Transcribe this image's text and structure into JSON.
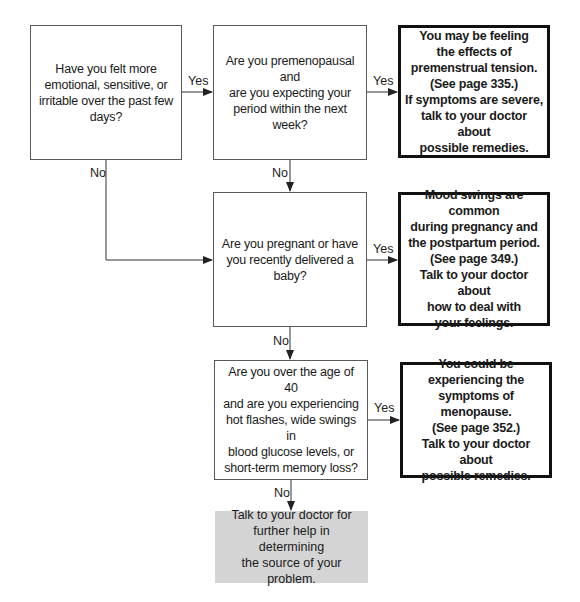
{
  "flowchart": {
    "nodes": {
      "q1": {
        "type": "question",
        "text": "Have you felt more\nemotional, sensitive, or\nirritable over the past few\ndays?"
      },
      "q2": {
        "type": "question",
        "text": "Are you premenopausal and\nare you expecting your\nperiod within the next week?"
      },
      "a1": {
        "type": "outcome",
        "text": "You may be feeling\nthe effects of\npremenstrual tension.\n(See page 335.)\nIf symptoms are severe,\ntalk to your doctor about\npossible remedies."
      },
      "q3": {
        "type": "question",
        "text": "Are you pregnant or have\nyou recently delivered a\nbaby?"
      },
      "a2": {
        "type": "outcome",
        "text": "Mood swings are common\nduring pregnancy and\nthe postpartum period.\n(See page 349.)\nTalk to your doctor about\nhow to deal with\nyour feelings."
      },
      "q4": {
        "type": "question",
        "text": "Are you over the age of 40\nand are you experiencing\nhot flashes, wide swings in\nblood glucose levels, or\nshort-term memory loss?"
      },
      "a3": {
        "type": "outcome",
        "text": "You could be\nexperiencing the\nsymptoms of menopause.\n(See page 352.)\nTalk to your doctor about\npossible remedies."
      },
      "end": {
        "type": "terminal",
        "text": "Talk to your doctor for\nfurther help in determining\nthe source of your problem."
      }
    },
    "edges": [
      {
        "from": "q1",
        "to": "q2",
        "label": "Yes"
      },
      {
        "from": "q1",
        "to": "q3",
        "label": "No"
      },
      {
        "from": "q2",
        "to": "a1",
        "label": "Yes"
      },
      {
        "from": "q2",
        "to": "q3",
        "label": "No"
      },
      {
        "from": "q3",
        "to": "a2",
        "label": "Yes"
      },
      {
        "from": "q3",
        "to": "q4",
        "label": "No"
      },
      {
        "from": "q4",
        "to": "a3",
        "label": "Yes"
      },
      {
        "from": "q4",
        "to": "end",
        "label": "No"
      }
    ],
    "colors": {
      "line": "#333333",
      "terminal_fill": "#d4d4d4",
      "outcome_border": "#111111"
    }
  }
}
